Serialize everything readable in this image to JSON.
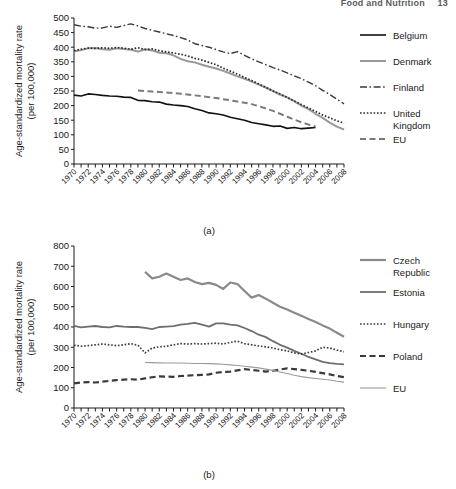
{
  "header": {
    "running_title": "Food and Nutrition",
    "page_number": "13"
  },
  "figure": {
    "captions": {
      "a": "(a)",
      "b": "(b)"
    },
    "y_axis_title_line1": "Age-standardized mortality rate",
    "y_axis_title_line2": "(per 100,000)"
  },
  "chart_data": [
    {
      "id": "a",
      "type": "line",
      "title": "",
      "caption": "(a)",
      "xlabel": "",
      "ylabel": "Age-standardized mortality rate (per 100,000)",
      "xlim": [
        1970,
        2008
      ],
      "ylim": [
        0,
        500
      ],
      "yticks": [
        0,
        50,
        100,
        150,
        200,
        250,
        300,
        350,
        400,
        450,
        500
      ],
      "xticks": [
        1970,
        1972,
        1974,
        1976,
        1978,
        1980,
        1982,
        1984,
        1986,
        1988,
        1990,
        1992,
        1994,
        1996,
        1998,
        2000,
        2002,
        2004,
        2006,
        2008
      ],
      "xtick_labels": [
        "1970",
        "1972",
        "1974",
        "1976",
        "1978",
        "1980",
        "1982",
        "1984",
        "1986",
        "1988",
        "1990",
        "1992",
        "1994",
        "1996",
        "1998",
        "2000",
        "2002",
        "2004",
        "2006",
        "2008"
      ],
      "grid": false,
      "legend_position": "right",
      "x": [
        1970,
        1971,
        1972,
        1973,
        1974,
        1975,
        1976,
        1977,
        1978,
        1979,
        1980,
        1981,
        1982,
        1983,
        1984,
        1985,
        1986,
        1987,
        1988,
        1989,
        1990,
        1991,
        1992,
        1993,
        1994,
        1995,
        1996,
        1997,
        1998,
        1999,
        2000,
        2001,
        2002,
        2003,
        2004,
        2005,
        2006,
        2007,
        2008
      ],
      "series": [
        {
          "name": "Belgium",
          "style": "solid",
          "color": "#111111",
          "width": 1.6,
          "values": [
            236,
            233,
            240,
            238,
            235,
            233,
            232,
            229,
            228,
            218,
            217,
            213,
            212,
            205,
            202,
            200,
            197,
            189,
            183,
            175,
            172,
            168,
            160,
            155,
            150,
            142,
            138,
            134,
            129,
            130,
            122,
            125,
            121,
            123,
            125,
            null,
            null,
            null,
            null
          ]
        },
        {
          "name": "Denmark",
          "style": "solid",
          "color": "#999999",
          "width": 2.0,
          "values": [
            385,
            390,
            396,
            397,
            393,
            391,
            396,
            394,
            391,
            385,
            393,
            389,
            381,
            379,
            372,
            360,
            352,
            348,
            340,
            333,
            327,
            319,
            310,
            300,
            292,
            282,
            272,
            262,
            250,
            238,
            228,
            215,
            200,
            188,
            172,
            158,
            142,
            128,
            118
          ]
        },
        {
          "name": "Finland",
          "style": "dashdot",
          "color": "#3a3a3a",
          "width": 1.4,
          "values": [
            477,
            472,
            470,
            465,
            466,
            472,
            468,
            474,
            480,
            473,
            464,
            458,
            452,
            446,
            440,
            433,
            425,
            412,
            406,
            400,
            392,
            384,
            378,
            385,
            372,
            360,
            350,
            340,
            330,
            322,
            312,
            302,
            292,
            280,
            268,
            252,
            238,
            222,
            206
          ]
        },
        {
          "name": "United Kingdom",
          "style": "dotted",
          "color": "#2a2a2a",
          "width": 1.7,
          "values": [
            388,
            393,
            397,
            396,
            398,
            396,
            399,
            397,
            393,
            398,
            392,
            394,
            388,
            384,
            380,
            376,
            370,
            362,
            356,
            348,
            340,
            328,
            318,
            308,
            296,
            286,
            274,
            262,
            250,
            240,
            228,
            216,
            204,
            192,
            180,
            168,
            158,
            148,
            140
          ]
        },
        {
          "name": "EU",
          "style": "dashed",
          "color": "#7a7a7a",
          "width": 2.0,
          "values": [
            null,
            null,
            null,
            null,
            null,
            null,
            null,
            null,
            null,
            252,
            250,
            248,
            247,
            245,
            243,
            241,
            238,
            235,
            232,
            229,
            226,
            222,
            218,
            214,
            210,
            205,
            198,
            190,
            182,
            172,
            162,
            152,
            143,
            135,
            128,
            null,
            null,
            null,
            null
          ]
        }
      ],
      "legend": [
        {
          "label": "Belgium",
          "style": "solid",
          "color": "#111111"
        },
        {
          "label": "Denmark",
          "style": "solid",
          "color": "#999999"
        },
        {
          "label": "Finland",
          "style": "dashdot",
          "color": "#3a3a3a"
        },
        {
          "label": "United Kingdom",
          "style": "dotted",
          "color": "#2a2a2a"
        },
        {
          "label": "EU",
          "style": "dashed",
          "color": "#7a7a7a"
        }
      ]
    },
    {
      "id": "b",
      "type": "line",
      "title": "",
      "caption": "(b)",
      "xlabel": "",
      "ylabel": "Age-standardized mortality rate (per 100,000)",
      "xlim": [
        1970,
        2008
      ],
      "ylim": [
        0,
        800
      ],
      "yticks": [
        0,
        100,
        200,
        300,
        400,
        500,
        600,
        700,
        800
      ],
      "xticks": [
        1970,
        1972,
        1974,
        1976,
        1978,
        1980,
        1982,
        1984,
        1986,
        1988,
        1990,
        1992,
        1994,
        1996,
        1998,
        2000,
        2002,
        2004,
        2006,
        2008
      ],
      "xtick_labels": [
        "1970",
        "1972",
        "1974",
        "1976",
        "1978",
        "1980",
        "1982",
        "1984",
        "1986",
        "1988",
        "1990",
        "1992",
        "1994",
        "1996",
        "1998",
        "2000",
        "2002",
        "2004",
        "2006",
        "2008"
      ],
      "grid": false,
      "legend_position": "right",
      "x": [
        1970,
        1971,
        1972,
        1973,
        1974,
        1975,
        1976,
        1977,
        1978,
        1979,
        1980,
        1981,
        1982,
        1983,
        1984,
        1985,
        1986,
        1987,
        1988,
        1989,
        1990,
        1991,
        1992,
        1993,
        1994,
        1995,
        1996,
        1997,
        1998,
        1999,
        2000,
        2001,
        2002,
        2003,
        2004,
        2005,
        2006,
        2007,
        2008
      ],
      "series": [
        {
          "name": "Czech Republic",
          "style": "solid",
          "color": "#8a8a8a",
          "width": 2.2,
          "values": [
            null,
            null,
            null,
            null,
            null,
            null,
            null,
            null,
            null,
            null,
            672,
            640,
            648,
            664,
            648,
            632,
            640,
            622,
            612,
            618,
            608,
            588,
            620,
            612,
            578,
            545,
            558,
            540,
            520,
            500,
            486,
            470,
            455,
            440,
            425,
            408,
            392,
            372,
            352
          ]
        },
        {
          "name": "Estonia",
          "style": "solid",
          "color": "#6e6e6e",
          "width": 1.8,
          "values": [
            405,
            398,
            402,
            405,
            400,
            398,
            405,
            402,
            400,
            400,
            396,
            390,
            400,
            402,
            404,
            412,
            415,
            420,
            412,
            402,
            418,
            418,
            412,
            408,
            395,
            380,
            362,
            350,
            330,
            312,
            298,
            282,
            268,
            252,
            240,
            228,
            222,
            218,
            215
          ]
        },
        {
          "name": "Hungary",
          "style": "dotted",
          "color": "#3a3a3a",
          "width": 1.7,
          "values": [
            310,
            305,
            308,
            312,
            316,
            312,
            308,
            312,
            318,
            310,
            272,
            296,
            302,
            305,
            312,
            318,
            316,
            318,
            316,
            318,
            320,
            316,
            324,
            330,
            318,
            312,
            306,
            302,
            296,
            288,
            282,
            272,
            266,
            274,
            282,
            300,
            296,
            286,
            278
          ]
        },
        {
          "name": "Poland",
          "style": "dashed",
          "color": "#3a3a3a",
          "width": 2.2,
          "values": [
            122,
            126,
            128,
            126,
            130,
            134,
            138,
            140,
            142,
            140,
            146,
            152,
            156,
            155,
            154,
            158,
            160,
            162,
            164,
            166,
            174,
            178,
            180,
            186,
            192,
            188,
            184,
            180,
            184,
            190,
            196,
            192,
            188,
            184,
            178,
            172,
            166,
            158,
            152
          ]
        },
        {
          "name": "EU",
          "style": "solid",
          "color": "#9b9b9b",
          "width": 1.1,
          "values": [
            null,
            null,
            null,
            null,
            null,
            null,
            null,
            null,
            null,
            null,
            225,
            224,
            223,
            222,
            222,
            222,
            221,
            220,
            220,
            219,
            218,
            216,
            213,
            210,
            206,
            202,
            198,
            192,
            186,
            178,
            170,
            162,
            155,
            150,
            146,
            142,
            138,
            132,
            128
          ]
        }
      ],
      "legend": [
        {
          "label": "Czech Republic",
          "style": "solid",
          "color": "#8a8a8a"
        },
        {
          "label": "Estonia",
          "style": "solid",
          "color": "#6e6e6e"
        },
        {
          "label": "Hungary",
          "style": "dotted",
          "color": "#3a3a3a"
        },
        {
          "label": "Poland",
          "style": "dashed",
          "color": "#3a3a3a"
        },
        {
          "label": "EU",
          "style": "solid",
          "color": "#9b9b9b"
        }
      ]
    }
  ]
}
